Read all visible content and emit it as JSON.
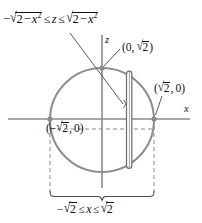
{
  "figure": {
    "title_label_top": {
      "text": "-sqrt(2 - x^2) <= z <= sqrt(2 - x^2)",
      "parts": {
        "minus": "−",
        "radicand": "2 − x",
        "exponent": "2",
        "leq": "≤",
        "variable_z": "z"
      }
    },
    "bottom_label": {
      "text": "-sqrt(2) <= x <= sqrt(2)",
      "parts": {
        "minus": "−",
        "radicand": "2",
        "leq": "≤",
        "variable_x": "x"
      }
    },
    "axes": {
      "x_label": "x",
      "z_label": "z"
    },
    "points": [
      {
        "name": "top",
        "label_open": "(0, ",
        "label_radicand": "2",
        "label_close": ")"
      },
      {
        "name": "right",
        "label_open": "(",
        "label_radicand": "2",
        "label_close": ", 0)"
      },
      {
        "name": "left",
        "label_open": "(−",
        "label_radicand": "2",
        "label_close": ", 0)"
      }
    ],
    "colors": {
      "circle_stroke": "#8f8f8f",
      "axis_stroke": "#8a8a8a",
      "strip_stroke": "#6e6e6e",
      "dashed_stroke": "#8a8a8a",
      "leader_stroke": "#4a4a4a",
      "dot_fill": "#8a8a8a",
      "text": "#111111",
      "background": "#ffffff"
    },
    "geometry": {
      "circle_center_x": 102,
      "circle_center_y": 120,
      "circle_radius": 52,
      "x_axis_y": 119,
      "z_axis_x": 102,
      "strip_left": 126,
      "strip_right": 132,
      "strip_top": 72,
      "strip_bottom": 168
    }
  }
}
